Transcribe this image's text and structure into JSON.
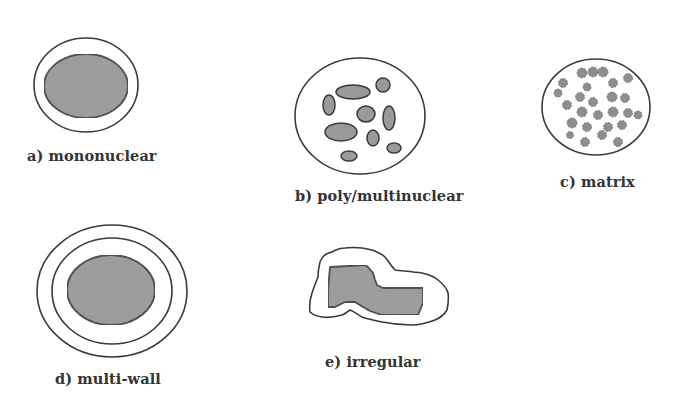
{
  "diagram": {
    "colors": {
      "background": "#ffffff",
      "stroke": "#3a3a3a",
      "core_fill": "#9a9a9a",
      "label_text": "#333333"
    },
    "panels": [
      {
        "id": "a",
        "label": "a) mononuclear",
        "description": "single core surrounded by one shell wall"
      },
      {
        "id": "b",
        "label": "b) poly/multinuclear",
        "description": "multiple discrete cores dispersed within one shell"
      },
      {
        "id": "c",
        "label": "c) matrix",
        "description": "core material finely dispersed throughout a matrix"
      },
      {
        "id": "d",
        "label": "d) multi-wall",
        "description": "single core surrounded by multiple concentric walls"
      },
      {
        "id": "e",
        "label": "e) irregular",
        "description": "irregularly shaped core and shell"
      }
    ]
  }
}
